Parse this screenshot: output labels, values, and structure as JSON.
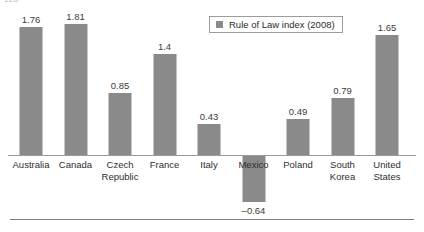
{
  "page": {
    "number": "126"
  },
  "legend": {
    "swatch_icon": "legend-swatch-icon",
    "label": "Rule of Law index (2008)",
    "position": "top-right"
  },
  "axis": {
    "zero_line_color": "#9a9a9a",
    "bottom_rule_color": "#7d7d7d"
  },
  "colors": {
    "bar": "#8a8a8a",
    "text": "#2e2e2e",
    "value_text": "#3a3a3a"
  },
  "chart_data": {
    "type": "bar",
    "title": "",
    "subtitle": "",
    "xlabel": "",
    "ylabel": "",
    "grid": false,
    "legend_position": "top-right",
    "ylim": [
      -0.8,
      2.0
    ],
    "categories": [
      "Australia",
      "Canada",
      "Czech Republic",
      "France",
      "Italy",
      "Mexico",
      "Poland",
      "South Korea",
      "United States"
    ],
    "category_lines": [
      [
        "Australia"
      ],
      [
        "Canada"
      ],
      [
        "Czech",
        "Republic"
      ],
      [
        "France"
      ],
      [
        "Italy"
      ],
      [
        "Mexico"
      ],
      [
        "Poland"
      ],
      [
        "South",
        "Korea"
      ],
      [
        "United",
        "States"
      ]
    ],
    "series": [
      {
        "name": "Rule of Law index (2008)",
        "values": [
          1.76,
          1.81,
          0.85,
          1.4,
          0.43,
          -0.64,
          0.49,
          0.79,
          1.65
        ],
        "labels": [
          "1.76",
          "1.81",
          "0.85",
          "1.4",
          "0.43",
          "–0.64",
          "0.49",
          "0.79",
          "1.65"
        ]
      }
    ]
  }
}
